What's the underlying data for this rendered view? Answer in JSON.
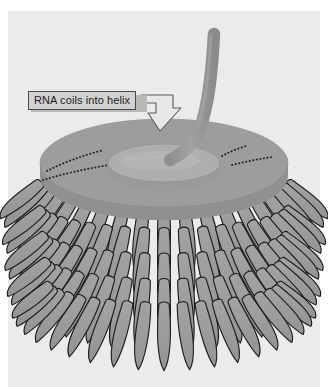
{
  "figure": {
    "domain": "biology-diagram",
    "background_color": "#ebebeb",
    "page_color": "#ffffff"
  },
  "annotation": {
    "label_text": "RNA coils into helix",
    "label_fill": "#d2d2d2",
    "label_border": "#4a4a4a",
    "arrow_name": "callout-arrow",
    "arrow_fill": "#e8e8e8",
    "arrow_border": "#5a5a5a"
  },
  "structures": {
    "rna_strand": {
      "name": "rna-strand",
      "color": "#9b9b9b",
      "shading": "#8e8e8e"
    },
    "disc": {
      "name": "protein-disc",
      "top_fill": "#9d9d9d",
      "inner_fill": "#aeaeae",
      "rim_fill": "#949494",
      "dotted_line_color": "#2a2a2a",
      "dotted_arcs": 4
    },
    "subunits": {
      "name": "protein-subunit-lobe",
      "fill": "#9a9a9a",
      "stroke": "#1e1e1e",
      "rows": 5,
      "per_row": 19,
      "shape": "elongated-teardrop"
    }
  }
}
